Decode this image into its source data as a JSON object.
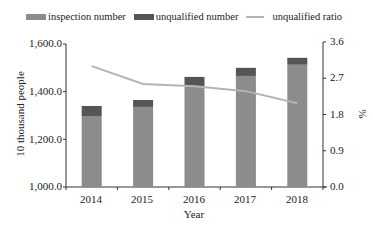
{
  "chart_data": {
    "type": "bar",
    "stacked": true,
    "categories": [
      "2014",
      "2015",
      "2016",
      "2017",
      "2018"
    ],
    "series": [
      {
        "name": "inspection number",
        "type": "bar",
        "axis": "left",
        "values": [
          1298,
          1336,
          1424,
          1466,
          1513
        ],
        "color": "#8c8c8c"
      },
      {
        "name": "unqualified number",
        "type": "bar",
        "axis": "left",
        "values": [
          42,
          29,
          38,
          34,
          29
        ],
        "color": "#555555"
      },
      {
        "name": "unqualified ratio",
        "type": "line",
        "axis": "right",
        "values": [
          3.0,
          2.56,
          2.5,
          2.38,
          2.08
        ],
        "color": "#b4b4b4"
      }
    ],
    "title": "",
    "xlabel": "Year",
    "ylabel": "10 thousand people",
    "y2label": "%",
    "ylim": [
      1000,
      1600
    ],
    "y2lim": [
      0,
      3.6
    ],
    "yticks": [
      "1,000.0",
      "1,200.0",
      "1,400.0",
      "1,600.0"
    ],
    "y2ticks": [
      "0.0",
      "0.9",
      "1.8",
      "2.7",
      "3.6"
    ],
    "grid": false,
    "legend_position": "top"
  },
  "legend": [
    {
      "label": "inspection number",
      "kind": "bar",
      "color": "#8c8c8c"
    },
    {
      "label": "unqualified number",
      "kind": "bar",
      "color": "#555555"
    },
    {
      "label": "unqualified ratio",
      "kind": "line",
      "color": "#b4b4b4"
    }
  ],
  "axes": {
    "xlabel": "Year",
    "ylabel": "10 thousand people",
    "y2label": "%",
    "yticks": [
      "1,000.0",
      "1,200.0",
      "1,400.0",
      "1,600.0"
    ],
    "y2ticks": [
      "0.0",
      "0.9",
      "1.8",
      "2.7",
      "3.6"
    ],
    "xticks": [
      "2014",
      "2015",
      "2016",
      "2017",
      "2018"
    ]
  }
}
